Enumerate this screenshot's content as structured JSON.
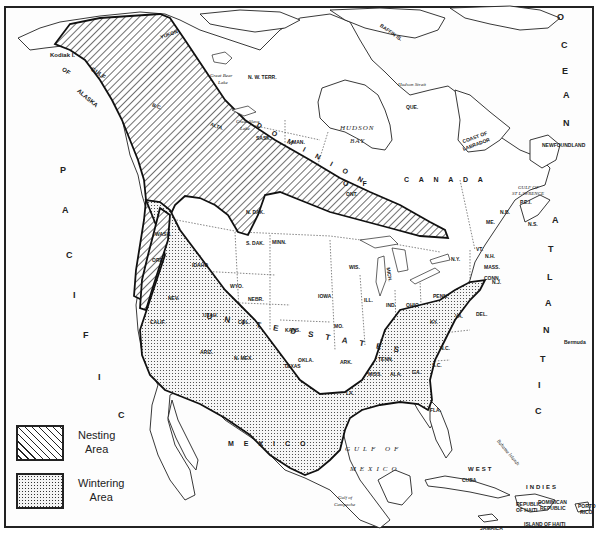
{
  "map": {
    "type": "range-map",
    "subject_regions": {
      "nesting": "Nesting Area",
      "wintering": "Wintering Area"
    },
    "colors": {
      "ink": "#222222",
      "paper": "#ffffff",
      "wintering_fill": "#f4f4f4"
    }
  },
  "legend": {
    "items": [
      {
        "key": "nesting",
        "line1": "Nesting",
        "line2": "Area",
        "pattern": "diagonal-hatch"
      },
      {
        "key": "wintering",
        "line1": "Wintering",
        "line2": "Area",
        "pattern": "stipple-dots"
      }
    ]
  },
  "labels": {
    "water": {
      "gulf_of_alaska": [
        "GULF",
        "OF",
        "ALASKA"
      ],
      "hudson_bay_1": "HUDSON",
      "hudson_bay_2": "BAY",
      "gulf_of_mexico_1": "GULF OF",
      "gulf_of_mexico_2": "MEXICO",
      "gulf_st_lawrence_1": "GULF OF",
      "gulf_st_lawrence_2": "ST LAWRENCE",
      "gulf_of_campeche_1": "Gulf of",
      "gulf_of_campeche_2": "Campeche",
      "hudson_strait": "Hudson Strait",
      "great_bear_lake_1": "Great Bear",
      "great_bear_lake_2": "Lake",
      "great_slave_lake_1": "Great Slave",
      "great_slave_lake_2": "Lake",
      "atlantic_letters": [
        "A",
        "T",
        "L",
        "A",
        "N",
        "T",
        "I",
        "C"
      ],
      "ocean_letters": [
        "O",
        "C",
        "E",
        "A",
        "N"
      ],
      "pacific_letters": [
        "P",
        "A",
        "C",
        "I",
        "F",
        "I",
        "C"
      ]
    },
    "regions": {
      "kodiak": "Kodiak I.",
      "nw_terr": "N. W. TERR.",
      "baffin": "BAFFIN IS.",
      "que": "QUE.",
      "coast_labrador_1": "COAST OF",
      "coast_labrador_2": "LABRADOR",
      "newfoundland": "NEWFOUNDLAND",
      "canada": "C A N A D A",
      "dominion": "D O M I N I O N",
      "of": "O F",
      "ont": "ONT.",
      "sask": "SASK.",
      "man": "MAN.",
      "alta": "ALTA.",
      "bc": "B.C.",
      "alaska": "ALASKA",
      "yukon": "YUKON",
      "nb": "N.B.",
      "ns": "N.S.",
      "pei": "P.E.I.",
      "bermuda": "Bermuda",
      "mexico": "M E X I C O",
      "west": "WEST",
      "indies": "INDIES",
      "cuba": "CUBA",
      "jamaica": "JAMAICA",
      "haiti_1": "REPUBLIC",
      "haiti_2": "OF HAITI",
      "dominican_1": "DOMINICAN",
      "dominican_2": "REPUBLIC",
      "island_haiti": "ISLAND OF HAITI",
      "puerto_rico_1": "PORTO",
      "puerto_rico_2": "RICO",
      "bahama": "Bahama Islands",
      "united_states": "U N I T E D   S T A T E S"
    },
    "states": {
      "wash": "WASH.",
      "ore": "ORE.",
      "calif": "CALIF.",
      "idaho": "IDAHO",
      "nev": "NEV.",
      "utah": "UTAH",
      "ariz": "ARIZ.",
      "mont": "MONT.",
      "wyo": "WYO.",
      "col": "COL.",
      "n_mex": "N. MEX.",
      "n_dak": "N. DAK.",
      "s_dak": "S. DAK.",
      "nebr": "NEBR.",
      "kans": "KANS.",
      "okla": "OKLA.",
      "texas": "TEXAS",
      "minn": "MINN.",
      "iowa": "IOWA",
      "mo": "MO.",
      "ark": "ARK.",
      "la": "LA.",
      "wis": "WIS.",
      "ill": "ILL.",
      "mich": "MICH.",
      "ind": "IND.",
      "ohio": "OHIO",
      "ky": "KY.",
      "tenn": "TENN.",
      "miss": "MISS.",
      "ala": "ALA.",
      "ga": "GA.",
      "fla": "FLA.",
      "sc": "S.C.",
      "nc": "N.C.",
      "va": "VA.",
      "wva": "W.VA.",
      "penn": "PENN.",
      "ny": "N.Y.",
      "vt": "VT.",
      "nh": "N.H.",
      "me": "ME.",
      "mass": "MASS.",
      "conn": "CONN.",
      "ri": "R.I.",
      "nj": "N.J.",
      "del": "DEL.",
      "md": "MD."
    }
  }
}
